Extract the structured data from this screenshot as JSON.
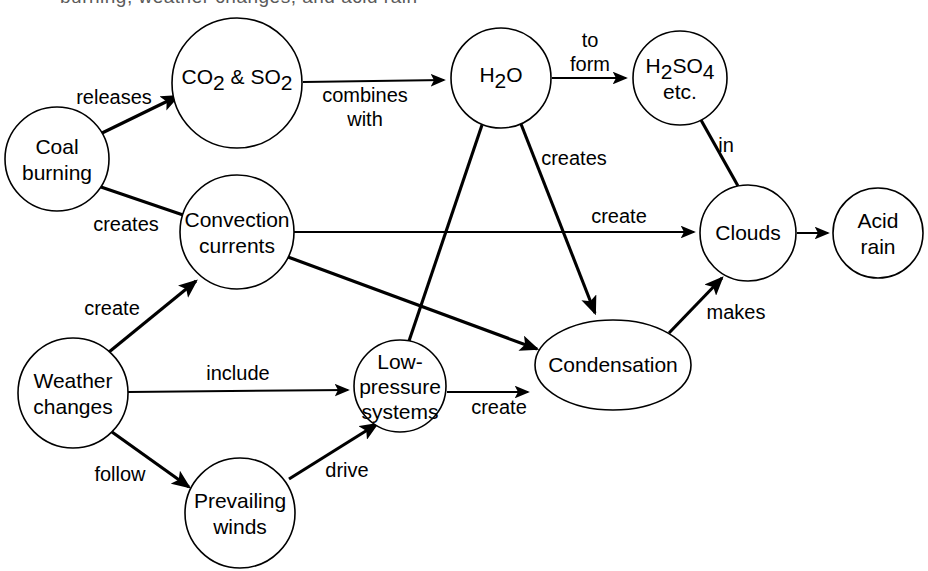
{
  "diagram": {
    "kind": "concept-map",
    "title_partial_cropped": "burning, weather changes, and acid rain",
    "background_color": "#ffffff",
    "stroke_color": "#000000",
    "nodes": [
      {
        "id": "coal",
        "label_lines": [
          "Coal",
          "burning"
        ],
        "shape": "circle",
        "cx": 57,
        "cy": 159,
        "r": 52
      },
      {
        "id": "co2so2",
        "label_lines": [
          "CO2 & SO2"
        ],
        "shape": "circle",
        "cx": 237,
        "cy": 83,
        "r": 65
      },
      {
        "id": "h2o",
        "label_lines": [
          "H2O"
        ],
        "shape": "circle",
        "cx": 501,
        "cy": 78,
        "r": 50
      },
      {
        "id": "h2so4",
        "label_lines": [
          "H2SO4",
          "etc."
        ],
        "shape": "circle",
        "cx": 680,
        "cy": 78,
        "r": 47
      },
      {
        "id": "convection",
        "label_lines": [
          "Convection",
          "currents"
        ],
        "shape": "circle",
        "cx": 237,
        "cy": 232,
        "r": 57
      },
      {
        "id": "clouds",
        "label_lines": [
          "Clouds"
        ],
        "shape": "circle",
        "cx": 748,
        "cy": 233,
        "r": 48
      },
      {
        "id": "acidrain",
        "label_lines": [
          "Acid",
          "rain"
        ],
        "shape": "circle",
        "cx": 878,
        "cy": 233,
        "r": 45
      },
      {
        "id": "weather",
        "label_lines": [
          "Weather",
          "changes"
        ],
        "shape": "circle",
        "cx": 73,
        "cy": 393,
        "r": 55
      },
      {
        "id": "lowpressure",
        "label_lines": [
          "Low-",
          "pressure",
          "systems"
        ],
        "shape": "circle",
        "cx": 400,
        "cy": 386,
        "r": 46
      },
      {
        "id": "condensation",
        "label_lines": [
          "Condensation"
        ],
        "shape": "ellipse",
        "cx": 613,
        "cy": 365,
        "rx": 78,
        "ry": 45
      },
      {
        "id": "winds",
        "label_lines": [
          "Prevailing",
          "winds"
        ],
        "shape": "circle",
        "cx": 240,
        "cy": 513,
        "r": 55
      }
    ],
    "edges": [
      {
        "id": "coal-co2",
        "from": "coal",
        "to": "co2so2",
        "label": "releases",
        "label_x": 114,
        "label_y": 99,
        "arrow": true
      },
      {
        "id": "coal-convection",
        "from": "coal",
        "to": "convection",
        "label": "creates",
        "label_x": 126,
        "label_y": 226,
        "arrow": false
      },
      {
        "id": "co2-h2o",
        "from": "co2so2",
        "to": "h2o",
        "label": "combines\nwith",
        "label_x": 365,
        "label_y": 97,
        "arrow": true
      },
      {
        "id": "h2o-h2so4",
        "from": "h2o",
        "to": "h2so4",
        "label": "to\nform",
        "label_x": 590,
        "label_y": 42,
        "arrow": true
      },
      {
        "id": "h2so4-clouds",
        "from": "h2so4",
        "to": "clouds",
        "label": "in",
        "label_x": 726,
        "label_y": 147,
        "arrow": false
      },
      {
        "id": "h2o-condensation",
        "from": "h2o",
        "to": "condensation",
        "label": "creates",
        "label_x": 574,
        "label_y": 160,
        "arrow": true
      },
      {
        "id": "h2o-lowpressure",
        "from": "h2o",
        "to": "lowpressure",
        "label": "",
        "label_x": 0,
        "label_y": 0,
        "arrow": false
      },
      {
        "id": "convection-clouds",
        "from": "convection",
        "to": "clouds",
        "label": "create",
        "label_x": 619,
        "label_y": 218,
        "arrow": true
      },
      {
        "id": "convection-cond",
        "from": "convection",
        "to": "condensation",
        "label": "",
        "label_x": 0,
        "label_y": 0,
        "arrow": true
      },
      {
        "id": "clouds-acidrain",
        "from": "clouds",
        "to": "acidrain",
        "label": "",
        "label_x": 0,
        "label_y": 0,
        "arrow": true
      },
      {
        "id": "cond-clouds",
        "from": "condensation",
        "to": "clouds",
        "label": "makes",
        "label_x": 736,
        "label_y": 314,
        "arrow": true
      },
      {
        "id": "weather-convection",
        "from": "weather",
        "to": "convection",
        "label": "create",
        "label_x": 112,
        "label_y": 310,
        "arrow": true
      },
      {
        "id": "weather-lowpressure",
        "from": "weather",
        "to": "lowpressure",
        "label": "include",
        "label_x": 238,
        "label_y": 375,
        "arrow": true
      },
      {
        "id": "weather-winds",
        "from": "weather",
        "to": "winds",
        "label": "follow",
        "label_x": 120,
        "label_y": 476,
        "arrow": true
      },
      {
        "id": "winds-lowpressure",
        "from": "winds",
        "to": "lowpressure",
        "label": "drive",
        "label_x": 347,
        "label_y": 472,
        "arrow": true
      },
      {
        "id": "lowpressure-cond",
        "from": "lowpressure",
        "to": "condensation",
        "label": "create",
        "label_x": 499,
        "label_y": 409,
        "arrow": true
      }
    ]
  }
}
